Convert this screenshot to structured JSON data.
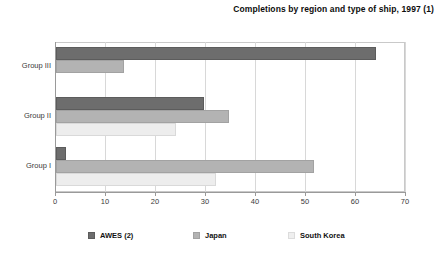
{
  "chart_data": {
    "type": "bar",
    "orientation": "horizontal",
    "title": "Completions by region and type of ship, 1997 (1)",
    "xlabel": "",
    "ylabel": "",
    "xlim": [
      0,
      70
    ],
    "xticks": [
      0,
      10,
      20,
      30,
      40,
      50,
      60,
      70
    ],
    "categories": [
      "Group III",
      "Group II",
      "Group I"
    ],
    "grid": true,
    "legend_position": "bottom",
    "series": [
      {
        "name": "AWES (2)",
        "color": "#6d6d6d",
        "values": [
          64.0,
          29.5,
          2.0
        ]
      },
      {
        "name": "Japan",
        "color": "#b3b3b3",
        "values": [
          13.5,
          34.5,
          51.5
        ]
      },
      {
        "name": "South Korea",
        "color": "#ededed",
        "values": [
          0.0,
          24.0,
          32.0
        ]
      }
    ]
  },
  "legend": {
    "items": [
      {
        "label": "AWES (2)"
      },
      {
        "label": "Japan"
      },
      {
        "label": "South Korea"
      }
    ]
  }
}
